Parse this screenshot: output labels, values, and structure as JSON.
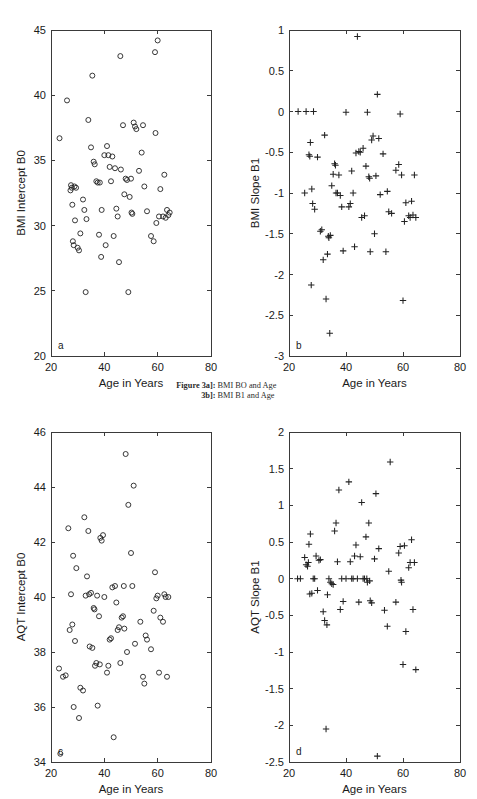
{
  "figure": {
    "caption_line1_lead": "Figure 3a]:",
    "caption_line1_text": "BMI BO and Age",
    "caption_line2_lead": "3b]:",
    "caption_line2_text": "BMI B1 and Age",
    "background_color": "#ffffff",
    "ink_color": "#222222"
  },
  "chart_data": [
    {
      "id": "panel-a",
      "type": "scatter",
      "panel_letter": "a",
      "title": "",
      "xlabel": "Age in Years",
      "ylabel": "BMI Intercept B0",
      "xlim": [
        20,
        80
      ],
      "ylim": [
        20,
        45
      ],
      "xticks": [
        20,
        40,
        60,
        80
      ],
      "yticks": [
        20,
        25,
        30,
        35,
        40,
        45
      ],
      "xtick_labels": [
        "20",
        "40",
        "60",
        "80"
      ],
      "ytick_labels": [
        "20",
        "25",
        "30",
        "35",
        "40",
        "45"
      ],
      "marker": "circle",
      "grid": false,
      "legend": "none",
      "x": [
        23.2,
        26.0,
        27.3,
        27.5,
        27.8,
        28.0,
        28.2,
        28.5,
        28.8,
        29.0,
        29.4,
        30.0,
        30.5,
        31.0,
        32.0,
        32.5,
        33.0,
        33.3,
        34.0,
        35.0,
        35.5,
        36.0,
        36.4,
        37.0,
        37.5,
        38.0,
        38.3,
        38.8,
        39.0,
        40.0,
        40.5,
        41.0,
        41.5,
        42.0,
        42.5,
        43.0,
        43.5,
        44.0,
        44.5,
        45.0,
        45.5,
        46.0,
        46.2,
        47.0,
        47.5,
        48.0,
        48.5,
        49.0,
        49.5,
        50.0,
        50.2,
        50.5,
        51.0,
        51.5,
        52.0,
        53.0,
        54.0,
        54.5,
        55.0,
        56.0,
        57.5,
        58.5,
        59.0,
        59.2,
        59.5,
        60.0,
        60.5,
        61.0,
        62.0,
        62.5,
        63.0,
        63.5,
        64.0,
        64.5
      ],
      "y": [
        36.7,
        39.6,
        32.7,
        33.1,
        32.9,
        31.6,
        28.8,
        28.5,
        33.0,
        30.4,
        32.9,
        28.3,
        28.1,
        29.4,
        32.0,
        31.2,
        24.9,
        30.5,
        38.1,
        36.0,
        41.5,
        34.9,
        34.7,
        33.4,
        33.3,
        29.3,
        33.3,
        27.6,
        31.2,
        35.4,
        28.5,
        36.1,
        35.4,
        34.5,
        33.4,
        35.3,
        29.2,
        34.4,
        31.3,
        30.7,
        27.2,
        43.0,
        34.3,
        37.7,
        32.4,
        33.6,
        33.5,
        24.9,
        32.2,
        33.6,
        31.0,
        30.9,
        37.9,
        37.6,
        37.4,
        34.2,
        35.6,
        37.7,
        33.0,
        31.1,
        29.2,
        28.8,
        43.3,
        37.1,
        30.2,
        44.2,
        30.7,
        32.8,
        30.7,
        33.9,
        30.6,
        31.2,
        30.8,
        31.0
      ]
    },
    {
      "id": "panel-b",
      "type": "scatter",
      "panel_letter": "b",
      "title": "",
      "xlabel": "Age in Years",
      "ylabel": "BMI Slope B1",
      "xlim": [
        20,
        80
      ],
      "ylim": [
        -3,
        1
      ],
      "xticks": [
        20,
        40,
        60,
        80
      ],
      "yticks": [
        -3,
        -2.5,
        -2,
        -1.5,
        -1,
        -0.5,
        0,
        0.5,
        1
      ],
      "xtick_labels": [
        "20",
        "40",
        "60",
        "80"
      ],
      "ytick_labels": [
        "-3",
        "-2.5",
        "-2",
        "-1.5",
        "-1",
        "-0.5",
        "0",
        "0.5",
        "1"
      ],
      "marker": "plus",
      "grid": false,
      "legend": "none",
      "x": [
        23.2,
        25.5,
        26.0,
        27.0,
        27.3,
        27.5,
        27.8,
        28.0,
        28.3,
        28.6,
        29.0,
        30.0,
        31.0,
        31.5,
        32.0,
        32.5,
        33.0,
        33.5,
        33.8,
        34.0,
        34.3,
        34.5,
        35.0,
        35.5,
        36.0,
        36.3,
        36.5,
        37.0,
        37.5,
        38.0,
        38.5,
        39.0,
        40.0,
        41.0,
        41.5,
        42.0,
        42.5,
        43.0,
        43.5,
        44.0,
        44.5,
        45.0,
        45.5,
        46.0,
        46.5,
        47.0,
        47.5,
        48.0,
        48.3,
        48.5,
        49.0,
        49.5,
        50.0,
        50.5,
        51.0,
        51.5,
        52.0,
        53.0,
        54.0,
        54.5,
        55.0,
        56.0,
        57.5,
        58.5,
        59.0,
        59.5,
        60.0,
        60.5,
        61.0,
        62.0,
        62.5,
        63.0,
        63.5,
        64.0,
        64.5
      ],
      "y": [
        0.0,
        -1.0,
        0.0,
        -0.53,
        -0.55,
        -0.38,
        -2.13,
        -0.95,
        -1.13,
        0.0,
        -1.2,
        -0.56,
        -1.47,
        -1.45,
        -1.82,
        -0.29,
        -2.3,
        -1.75,
        -1.53,
        -1.55,
        -2.72,
        -1.52,
        -0.91,
        -0.77,
        -0.64,
        -0.66,
        -1.0,
        -1.0,
        -0.78,
        -1.03,
        -1.17,
        -1.71,
        -0.01,
        -1.17,
        -1.13,
        -0.73,
        -1.0,
        -1.66,
        -0.51,
        0.92,
        -0.49,
        -0.5,
        -1.3,
        -0.45,
        -1.28,
        -0.67,
        -0.01,
        -0.8,
        -0.82,
        -1.72,
        -0.35,
        -0.3,
        -1.5,
        -0.79,
        0.21,
        -0.33,
        -1.02,
        -0.52,
        -1.72,
        -0.98,
        -1.23,
        -1.25,
        -0.72,
        -0.65,
        -0.03,
        -0.78,
        -2.32,
        -1.35,
        -1.12,
        -1.28,
        -1.3,
        -1.1,
        -1.27,
        -0.78,
        -1.3
      ]
    },
    {
      "id": "panel-c",
      "type": "scatter",
      "panel_letter": "c",
      "title": "",
      "xlabel": "Age in Years",
      "ylabel": "AQT Intercept B0",
      "xlim": [
        20,
        80
      ],
      "ylim": [
        34,
        46
      ],
      "xticks": [
        20,
        40,
        60,
        80
      ],
      "yticks": [
        34,
        36,
        38,
        40,
        42,
        44,
        46
      ],
      "xtick_labels": [
        "20",
        "40",
        "60",
        "80"
      ],
      "ytick_labels": [
        "34",
        "36",
        "38",
        "40",
        "42",
        "44",
        "46"
      ],
      "marker": "circle",
      "grid": false,
      "legend": "none",
      "x": [
        23.0,
        23.5,
        24.5,
        25.5,
        26.5,
        27.0,
        27.5,
        28.0,
        28.3,
        28.5,
        29.0,
        29.5,
        30.5,
        31.0,
        32.0,
        32.5,
        33.0,
        33.5,
        34.0,
        34.3,
        34.5,
        35.0,
        35.5,
        36.0,
        36.3,
        36.5,
        37.0,
        37.3,
        37.5,
        38.0,
        38.3,
        38.5,
        39.0,
        39.5,
        40.0,
        41.0,
        41.5,
        42.0,
        42.5,
        43.0,
        43.5,
        44.0,
        44.5,
        45.0,
        45.5,
        46.0,
        46.5,
        47.0,
        47.3,
        47.5,
        48.0,
        48.5,
        49.0,
        50.0,
        50.5,
        51.0,
        51.5,
        53.5,
        54.5,
        55.0,
        55.5,
        56.0,
        57.5,
        58.5,
        59.0,
        59.5,
        60.0,
        60.5,
        61.0,
        62.0,
        62.5,
        63.0,
        63.5,
        64.0
      ],
      "y": [
        37.4,
        34.3,
        37.1,
        37.15,
        42.5,
        38.8,
        40.1,
        39.0,
        41.5,
        36.0,
        38.4,
        41.05,
        35.6,
        36.7,
        36.6,
        42.9,
        40.05,
        40.75,
        42.4,
        40.1,
        38.2,
        40.15,
        38.15,
        39.6,
        39.55,
        37.5,
        37.6,
        40.05,
        36.05,
        39.3,
        37.55,
        42.15,
        42.05,
        42.25,
        40.0,
        37.25,
        37.5,
        38.45,
        38.5,
        40.35,
        34.9,
        40.4,
        39.8,
        38.8,
        38.9,
        37.6,
        39.25,
        39.3,
        40.4,
        38.85,
        45.2,
        38.0,
        43.35,
        41.6,
        40.4,
        44.05,
        38.3,
        39.1,
        37.1,
        36.85,
        38.6,
        38.45,
        38.1,
        39.5,
        40.9,
        39.95,
        40.05,
        37.25,
        39.25,
        39.1,
        40.1,
        40.0,
        37.1,
        40.0
      ]
    },
    {
      "id": "panel-d",
      "type": "scatter",
      "panel_letter": "d",
      "title": "",
      "xlabel": "Age in Years",
      "ylabel": "AQT Slope B1",
      "xlim": [
        20,
        80
      ],
      "ylim": [
        -2.5,
        2
      ],
      "xticks": [
        20,
        40,
        60,
        80
      ],
      "yticks": [
        -2.5,
        -2,
        -1.5,
        -1,
        -0.5,
        0,
        0.5,
        1,
        1.5,
        2
      ],
      "xtick_labels": [
        "20",
        "40",
        "60",
        "80"
      ],
      "ytick_labels": [
        "-2.5",
        "-2",
        "-1.5",
        "-1",
        "-0.5",
        "0",
        "0.5",
        "1",
        "1.5",
        "2"
      ],
      "marker": "plus",
      "grid": false,
      "legend": "none",
      "x": [
        23.0,
        24.0,
        25.5,
        26.0,
        26.5,
        26.8,
        27.0,
        27.3,
        27.5,
        28.0,
        28.5,
        29.0,
        29.5,
        30.0,
        30.5,
        31.0,
        32.0,
        32.5,
        33.0,
        33.3,
        33.5,
        34.0,
        34.5,
        35.0,
        35.5,
        36.0,
        36.5,
        37.0,
        37.5,
        38.0,
        38.5,
        39.0,
        40.0,
        41.0,
        41.5,
        42.0,
        42.5,
        43.0,
        43.5,
        44.0,
        44.5,
        45.0,
        45.5,
        46.0,
        46.5,
        47.0,
        47.3,
        47.5,
        48.0,
        48.3,
        48.5,
        49.0,
        50.0,
        50.5,
        51.0,
        51.5,
        53.5,
        54.5,
        55.0,
        55.5,
        57.5,
        58.5,
        59.0,
        59.3,
        59.5,
        60.0,
        60.5,
        61.0,
        62.0,
        62.5,
        63.0,
        63.5,
        64.0,
        64.5
      ],
      "y": [
        0.0,
        0.0,
        0.29,
        0.19,
        0.17,
        0.22,
        0.47,
        -0.21,
        0.61,
        -0.2,
        0.0,
        0.0,
        0.31,
        -0.16,
        0.25,
        0.26,
        -0.45,
        -0.57,
        -2.05,
        -0.63,
        -0.22,
        0.0,
        -0.05,
        -0.07,
        -0.08,
        0.65,
        0.76,
        0.23,
        1.21,
        -0.42,
        0.0,
        -0.31,
        0.0,
        1.32,
        0.23,
        0.0,
        0.0,
        0.31,
        0.46,
        0.0,
        -0.32,
        0.3,
        1.04,
        0.0,
        0.0,
        0.57,
        0.0,
        -0.05,
        0.76,
        -0.03,
        -0.3,
        -0.33,
        0.27,
        1.16,
        -2.42,
        0.41,
        -0.43,
        -0.65,
        0.1,
        1.59,
        -0.32,
        0.35,
        0.44,
        -0.02,
        -0.05,
        -1.17,
        0.45,
        -0.72,
        0.15,
        0.22,
        0.53,
        -0.42,
        0.22,
        -1.24
      ]
    }
  ]
}
